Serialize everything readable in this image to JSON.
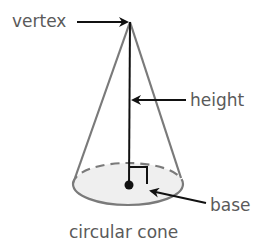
{
  "diagram": {
    "title": "circular cone",
    "labels": {
      "vertex": "vertex",
      "height": "height",
      "base": "base"
    },
    "colors": {
      "text": "#5a5a5a",
      "cone_outline": "#7a7a7a",
      "base_fill": "#efefef",
      "height_line": "#111111",
      "arrow": "#111111"
    }
  }
}
